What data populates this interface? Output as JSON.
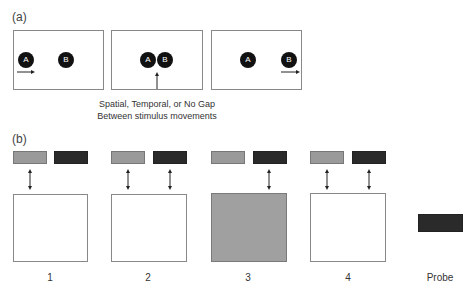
{
  "panel_a": {
    "label": "(a)",
    "frames": [
      {
        "circles": [
          {
            "label": "A"
          },
          {
            "label": "B"
          }
        ]
      },
      {
        "circles": [
          {
            "label": "A"
          },
          {
            "label": "B"
          }
        ]
      },
      {
        "circles": [
          {
            "label": "A"
          },
          {
            "label": "B"
          }
        ]
      }
    ],
    "caption_line1": "Spatial, Temporal, or No Gap",
    "caption_line2": "Between stimulus movements"
  },
  "panel_b": {
    "label": "(b)",
    "trials": [
      {
        "number": "1",
        "arrows": [
          "gray"
        ],
        "box_fill": "white"
      },
      {
        "number": "2",
        "arrows": [
          "gray",
          "dark"
        ],
        "box_fill": "white"
      },
      {
        "number": "3",
        "arrows": [
          "dark"
        ],
        "box_fill": "gray"
      },
      {
        "number": "4",
        "arrows": [
          "gray",
          "dark"
        ],
        "box_fill": "white"
      }
    ],
    "probe_label": "Probe"
  },
  "colors": {
    "gray_bar": "#9a9a9a",
    "dark_bar": "#2a2a2a",
    "gray_box": "#a0a0a0",
    "circle": "#111111"
  }
}
